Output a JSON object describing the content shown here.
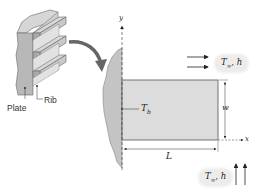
{
  "figure": {
    "labels": {
      "plate": "Plate",
      "rib": "Rib",
      "base_temperature": "T",
      "base_temperature_sub": "b",
      "width": "w",
      "length": "L",
      "x_axis": "x",
      "y_axis": "y"
    },
    "fluid_top": {
      "symbol": "T",
      "sub": "∞",
      "rest": ", h"
    },
    "fluid_bottom": {
      "symbol": "T",
      "sub": "∞",
      "rest": ", h"
    },
    "colors": {
      "fin_fill": "#dcdcdc",
      "wall_fill": "#c4c4c4",
      "stroke": "#555555",
      "bubble": "#ececec"
    }
  }
}
